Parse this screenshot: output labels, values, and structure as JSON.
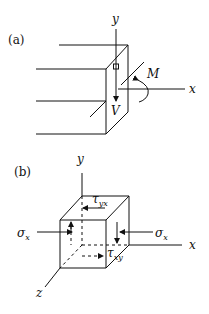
{
  "figure": {
    "panel_a": {
      "label": "(a)",
      "axes": {
        "y": "y",
        "x": "x"
      },
      "moment_label": "M",
      "shear_label": "V"
    },
    "panel_b": {
      "label": "(b)",
      "axes": {
        "y": "y",
        "x": "x",
        "z": "z"
      },
      "stress_left_label": "σ",
      "stress_left_sub": "x",
      "stress_right_label": "σ",
      "stress_right_sub": "x",
      "shear_top_label": "τ",
      "shear_top_sub": "yx",
      "shear_side_label": "τ",
      "shear_side_sub": "xy"
    },
    "colors": {
      "stroke": "#111111",
      "background": "#ffffff"
    }
  }
}
